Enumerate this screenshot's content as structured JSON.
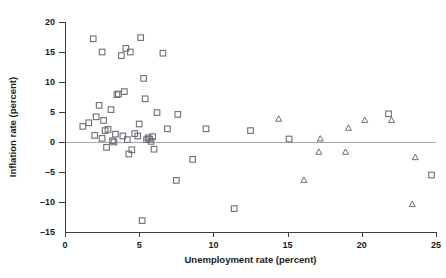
{
  "chart_data": {
    "type": "scatter",
    "title": "",
    "xlabel": "Unemployment rate (percent)",
    "ylabel": "Inflation rate (percent)",
    "xlim": [
      0,
      25
    ],
    "ylim": [
      -15,
      20
    ],
    "xticks": [
      0,
      5,
      10,
      15,
      20,
      25
    ],
    "yticks": [
      20,
      15,
      10,
      5,
      0,
      -5,
      -10,
      -15
    ],
    "xtick_labels": [
      "0",
      "5",
      "10",
      "15",
      "20",
      "25"
    ],
    "ytick_labels": [
      "20",
      "15",
      "10",
      "5",
      "0",
      "-5",
      "-10",
      "-15"
    ],
    "grid": false,
    "legend": null,
    "reference_lines": [
      {
        "type": "horizontal",
        "value": 0,
        "color": "#a8a8a8"
      }
    ],
    "marker_colors": {
      "square": "#6e6e78",
      "triangle": "#6e6e78"
    },
    "series": [
      {
        "name": "square-markers",
        "marker": "square",
        "points": [
          [
            1.2,
            2.6
          ],
          [
            1.6,
            3.2
          ],
          [
            1.9,
            17.2
          ],
          [
            2.0,
            1.1
          ],
          [
            2.1,
            4.2
          ],
          [
            2.3,
            6.1
          ],
          [
            2.5,
            15.0
          ],
          [
            2.5,
            0.6
          ],
          [
            2.6,
            3.6
          ],
          [
            2.7,
            1.9
          ],
          [
            2.8,
            -0.9
          ],
          [
            2.9,
            2.1
          ],
          [
            3.1,
            5.4
          ],
          [
            3.2,
            0.2
          ],
          [
            3.3,
            0.0
          ],
          [
            3.4,
            1.3
          ],
          [
            3.5,
            7.9
          ],
          [
            3.6,
            8.0
          ],
          [
            3.8,
            14.4
          ],
          [
            3.9,
            1.0
          ],
          [
            4.0,
            8.4
          ],
          [
            4.1,
            15.6
          ],
          [
            4.2,
            0.4
          ],
          [
            4.3,
            -2.0
          ],
          [
            4.4,
            15.0
          ],
          [
            4.5,
            -1.3
          ],
          [
            4.7,
            1.4
          ],
          [
            4.9,
            1.0
          ],
          [
            5.0,
            3.0
          ],
          [
            5.1,
            17.4
          ],
          [
            5.2,
            -13.1
          ],
          [
            5.3,
            10.6
          ],
          [
            5.4,
            7.2
          ],
          [
            5.5,
            0.4
          ],
          [
            5.6,
            0.7
          ],
          [
            5.7,
            0.5
          ],
          [
            5.8,
            0.1
          ],
          [
            5.9,
            0.9
          ],
          [
            6.0,
            -1.2
          ],
          [
            6.2,
            4.9
          ],
          [
            6.6,
            14.8
          ],
          [
            6.9,
            2.2
          ],
          [
            7.5,
            -6.4
          ],
          [
            7.6,
            4.6
          ],
          [
            8.6,
            -2.9
          ],
          [
            9.5,
            2.2
          ],
          [
            11.4,
            -11.1
          ],
          [
            12.5,
            1.9
          ],
          [
            15.1,
            0.5
          ],
          [
            21.8,
            4.7
          ],
          [
            24.7,
            -5.5
          ]
        ]
      },
      {
        "name": "triangle-markers",
        "marker": "triangle",
        "points": [
          [
            14.4,
            3.8
          ],
          [
            16.1,
            -6.4
          ],
          [
            17.1,
            -1.7
          ],
          [
            17.2,
            0.5
          ],
          [
            18.9,
            -1.7
          ],
          [
            19.1,
            2.3
          ],
          [
            20.2,
            3.6
          ],
          [
            22.0,
            3.6
          ],
          [
            23.4,
            -10.4
          ],
          [
            23.6,
            -2.6
          ]
        ]
      }
    ]
  },
  "geometry": {
    "plot_left_px": 65,
    "plot_right_px": 436,
    "y_top_px": 22,
    "y_bottom_px": 232
  }
}
